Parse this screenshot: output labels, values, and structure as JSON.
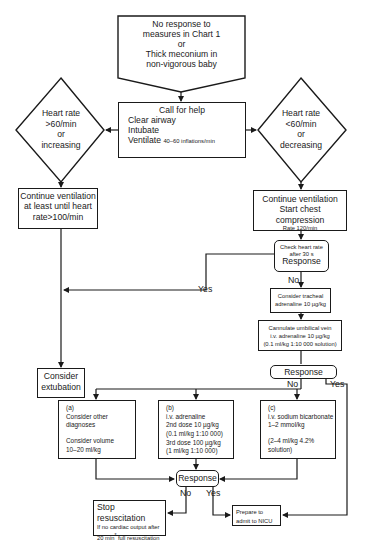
{
  "start": {
    "line1": "No response to",
    "line2": "measures in Chart 1",
    "line3": "or",
    "line4": "Thick meconium in",
    "line5": "non-vigorous baby"
  },
  "call_for_help": {
    "title": "Call for help",
    "line1": "Clear airway",
    "line2": "Intubate",
    "line3": "Ventilate",
    "line3_small": "40–60 inflations/min"
  },
  "decision_left": {
    "line1": "Heart rate",
    "line2": ">60/min",
    "line3": "or",
    "line4": "increasing"
  },
  "decision_right": {
    "line1": "Heart rate",
    "line2": "<60/min",
    "line3": "or",
    "line4": "decreasing"
  },
  "continue_left": {
    "line1": "Continue ventilation",
    "line2": "at least until heart",
    "line3": "rate>100/min"
  },
  "continue_right": {
    "line1": "Continue ventilation",
    "line2": "Start chest compression",
    "line3": "Rate 120/min"
  },
  "check_hr": {
    "line1": "Check heart rate",
    "line2": "after 30 s",
    "line3": "Response"
  },
  "tracheal": {
    "line1": "Consider tracheal",
    "line2": "adrenaline 10 µg/kg"
  },
  "cannulate": {
    "line1": "Cannulate umbilical vein",
    "line2": "i.v. adrenaline 10 µg/kg",
    "line3": "(0.1 ml/kg 1:10 000 solution)"
  },
  "response_mid": {
    "label": "Response"
  },
  "extubation": {
    "line1": "Consider",
    "line2": "extubation"
  },
  "option_a": {
    "tag": "(a)",
    "line1": "Consider other",
    "line2": "diagnoses",
    "line3": "Consider volume",
    "line4": "10–20 ml/kg"
  },
  "option_b": {
    "tag": "(b)",
    "line1": "i.v. adrenaline",
    "line2": "2nd dose 10 µg/kg",
    "line3": "(0.1 ml/kg 1:10 000)",
    "line4": "3rd dose 100 µg/kg",
    "line5": "(1 ml/kg 1:10 000)"
  },
  "option_c": {
    "tag": "(c)",
    "line1": "i.v. sodium bicarbonate",
    "line2": "1–2 mmol/kg",
    "line3": "(2–4 ml/kg 4.2%",
    "line4": "solution)"
  },
  "response_bottom": {
    "label": "Response"
  },
  "stop": {
    "title": "Stop resuscitation",
    "line1": "If no cardiac output after",
    "line2a": "20 min",
    "line2sup": "*",
    "line2b": " full resuscitation"
  },
  "prepare": {
    "line1": "Prepare to",
    "line2": "admit to NICU"
  },
  "labels": {
    "yes_check": "Yes",
    "no_check": "No",
    "no_mid": "No",
    "yes_mid": "Yes",
    "no_bottom": "No",
    "yes_bottom": "Yes"
  }
}
